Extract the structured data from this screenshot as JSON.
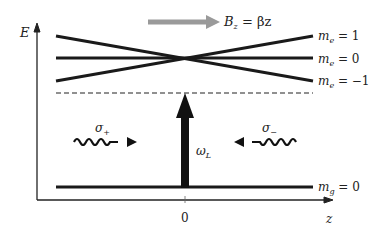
{
  "diagram": {
    "axes": {
      "y_label": "E",
      "x_label": "z",
      "x_origin_tick": "0"
    },
    "field": {
      "label_main": "B",
      "label_sub": "z",
      "label_rest": " = βz",
      "arrow_color": "#9a9a9a"
    },
    "excited_levels": [
      {
        "label_main": "m",
        "label_sub": "e",
        "label_rest": " = 1"
      },
      {
        "label_main": "m",
        "label_sub": "e",
        "label_rest": " = 0"
      },
      {
        "label_main": "m",
        "label_sub": "e",
        "label_rest": " = −1"
      }
    ],
    "ground_level": {
      "label_main": "m",
      "label_sub": "g",
      "label_rest": " = 0"
    },
    "laser": {
      "label_main": "ω",
      "label_sub": "L"
    },
    "beams": [
      {
        "label_main": "σ",
        "label_sub": "+",
        "direction": "right"
      },
      {
        "label_main": "σ",
        "label_sub": "−",
        "direction": "left"
      }
    ],
    "detuning_line": "dashed",
    "line_color": "#1a1a1a"
  }
}
